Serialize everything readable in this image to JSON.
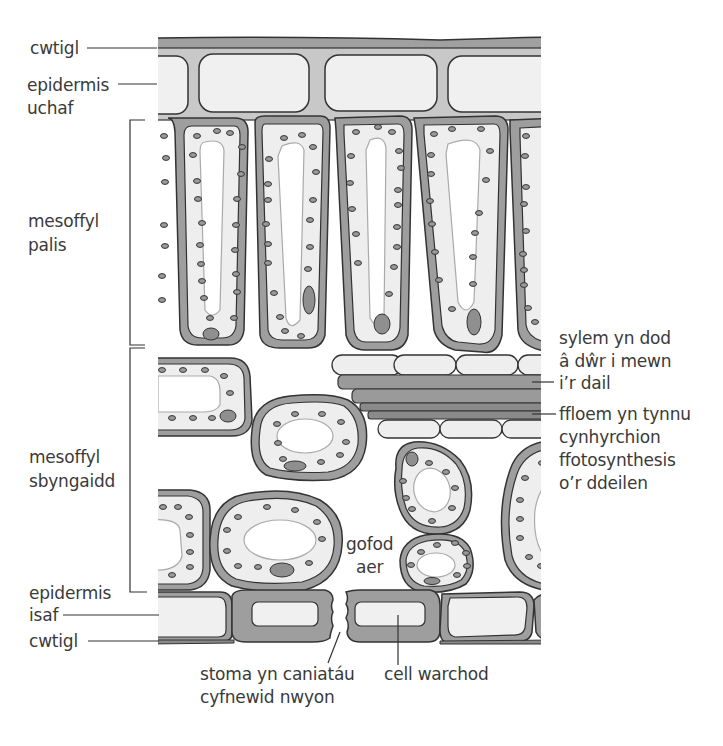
{
  "diagram": {
    "type": "leaf cross-section",
    "colors": {
      "cell_wall": "#9e9e9e",
      "outline": "#333333",
      "cytoplasm": "#eeeeee",
      "vacuole": "#ffffff",
      "vacuole_edge": "#aaaaaa",
      "nucleus": "#8f8f8f",
      "chloroplast": "#999999",
      "label_text": "#3a3a3a"
    },
    "labels": {
      "cuticle_top": "cwtigl",
      "upper_epidermis_1": "epidermis",
      "upper_epidermis_2": "uchaf",
      "palisade_1": "mesoffyl",
      "palisade_2": "palis",
      "spongy_1": "mesoffyl",
      "spongy_2": "sbyngaidd",
      "lower_epidermis_1": "epidermis",
      "lower_epidermis_2": "isaf",
      "cuticle_bottom": "cwtigl",
      "xylem_1": "sylem yn dod",
      "xylem_2": "â dŵr i mewn",
      "xylem_3": "i’r dail",
      "phloem_1": "ffloem yn tynnu",
      "phloem_2": "cynhyrchion",
      "phloem_3": "ffotosynthesis",
      "phloem_4": "o’r ddeilen",
      "air_space_1": "gofod",
      "air_space_2": "aer",
      "stoma_1": "stoma yn caniatáu",
      "stoma_2": "cyfnewid nwyon",
      "guard_cell": "cell warchod"
    }
  }
}
